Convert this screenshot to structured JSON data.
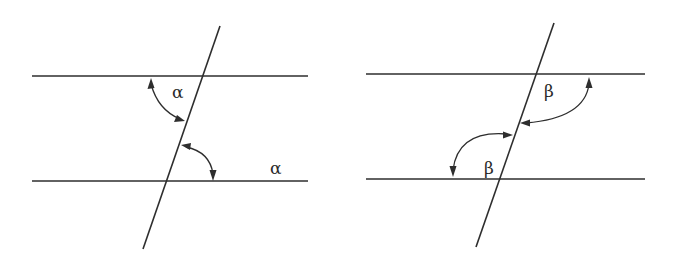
{
  "figure": {
    "left_panel": {
      "angle_symbol": "α",
      "labels": [
        {
          "text": "α",
          "x": 172,
          "y": 98
        },
        {
          "text": "α",
          "x": 270,
          "y": 174
        }
      ],
      "parallel_lines": [
        {
          "x1": 32,
          "y1": 76,
          "x2": 308,
          "y2": 76
        },
        {
          "x1": 32,
          "y1": 181,
          "x2": 308,
          "y2": 181
        }
      ],
      "transversal": {
        "x1": 220,
        "y1": 26,
        "x2": 143,
        "y2": 249
      }
    },
    "right_panel": {
      "angle_symbol": "β",
      "labels": [
        {
          "text": "β",
          "x": 544,
          "y": 97
        },
        {
          "text": "β",
          "x": 484,
          "y": 174
        }
      ],
      "parallel_lines": [
        {
          "x1": 366,
          "y1": 74,
          "x2": 645,
          "y2": 74
        },
        {
          "x1": 366,
          "y1": 179,
          "x2": 645,
          "y2": 179
        }
      ],
      "transversal": {
        "x1": 554,
        "y1": 23,
        "x2": 476,
        "y2": 247
      }
    }
  },
  "colors": {
    "stroke": "#2e2e2e",
    "background": "#ffffff"
  }
}
